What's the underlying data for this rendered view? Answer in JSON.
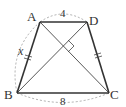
{
  "diagram": {
    "type": "isosceles trapezoid",
    "vertices": {
      "A": {
        "label": "A",
        "x": 40,
        "y": 22
      },
      "D": {
        "label": "D",
        "x": 87,
        "y": 22
      },
      "B": {
        "label": "B",
        "x": 17,
        "y": 93
      },
      "C": {
        "label": "C",
        "x": 109,
        "y": 93
      }
    },
    "side_labels": {
      "AD": "4",
      "BC": "8",
      "AB": "x"
    },
    "annotations": {
      "diagonals_perpendicular": true,
      "equal_sides": [
        "AB",
        "DC"
      ]
    },
    "colors": {
      "stroke": "#333333",
      "dashed": "#888888"
    }
  }
}
